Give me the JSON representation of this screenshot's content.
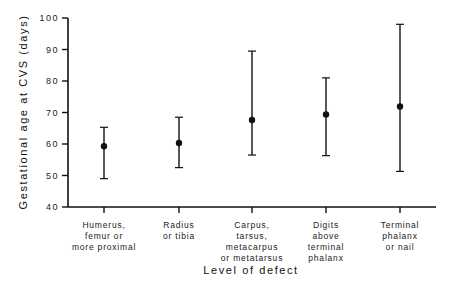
{
  "chart_data": {
    "type": "errorbar",
    "title": "",
    "xlabel": "Level of defect",
    "ylabel": "Gestational age at CVS (days)",
    "ylim": [
      40,
      100
    ],
    "yticks": [
      40,
      50,
      60,
      70,
      80,
      90,
      100
    ],
    "grid": false,
    "legend": null,
    "categories": [
      [
        "Humerus,",
        "femur or",
        "more proximal"
      ],
      [
        "Radius",
        "or tibia"
      ],
      [
        "Carpus,",
        "tarsus,",
        "metacarpus",
        "or metatarsus"
      ],
      [
        "Digits",
        "above",
        "terminal",
        "phalanx"
      ],
      [
        "Terminal",
        "phalanx",
        "or nail"
      ]
    ],
    "series": [
      {
        "name": "Gestational age at CVS",
        "mean": [
          59.3,
          60.3,
          67.6,
          69.4,
          71.9
        ],
        "upper": [
          65.3,
          68.5,
          89.5,
          81.0,
          98.0
        ],
        "lower": [
          49.0,
          52.5,
          56.5,
          56.3,
          51.3
        ]
      }
    ]
  }
}
